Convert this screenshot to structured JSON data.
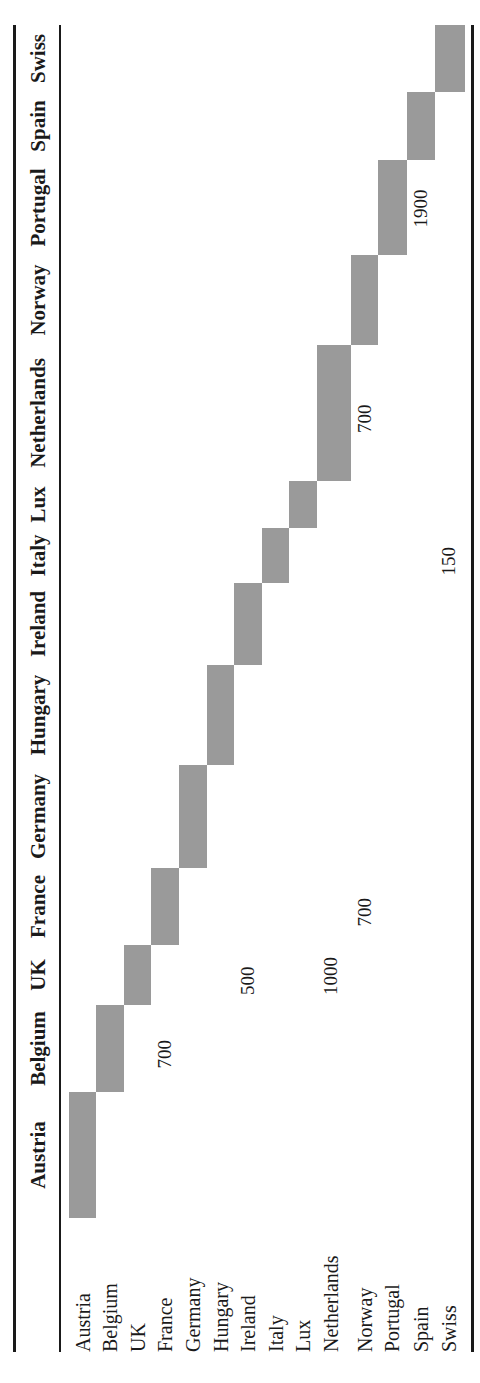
{
  "table": {
    "columns": [
      "Austria",
      "Belgium",
      "UK",
      "France",
      "Germany",
      "Hungary",
      "Ireland",
      "Italy",
      "Lux",
      "Netherlands",
      "Norway",
      "Portugal",
      "Spain",
      "Swiss"
    ],
    "rows": [
      "Austria",
      "Belgium",
      "UK",
      "France",
      "Germany",
      "Hungary",
      "Ireland",
      "Italy",
      "Lux",
      "Netherlands",
      "Norway",
      "Portugal",
      "Spain",
      "Swiss"
    ],
    "diagonal_color": "#9a9a9a",
    "values": [
      {
        "row": "France",
        "column": "Belgium",
        "value": "700"
      },
      {
        "row": "Ireland",
        "column": "UK",
        "value": "500"
      },
      {
        "row": "Netherlands",
        "column": "UK",
        "value": "1000"
      },
      {
        "row": "Norway",
        "column": "France",
        "value": "700"
      },
      {
        "row": "Norway",
        "column": "Netherlands",
        "value": "700"
      },
      {
        "row": "Swiss",
        "column": "Italy",
        "value": "150"
      },
      {
        "row": "Spain",
        "column": "Portugal",
        "value": "1900"
      }
    ]
  }
}
